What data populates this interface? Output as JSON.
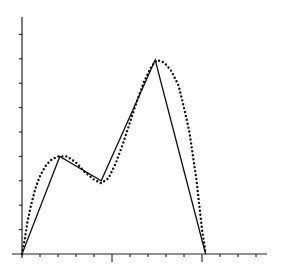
{
  "chart_data": {
    "type": "line",
    "title": "",
    "xlabel": "",
    "ylabel": "",
    "grid": false,
    "legend": null,
    "xlim": [
      -0.55,
      13.6
    ],
    "ylim": [
      0,
      9.7
    ],
    "x_ticks": [
      1,
      2,
      3,
      4,
      5,
      6,
      7,
      8,
      9,
      10,
      11,
      12,
      13
    ],
    "x_major_ticks": [
      5,
      10
    ],
    "y_ticks": [
      1,
      2,
      3,
      4,
      5,
      6,
      7,
      8,
      9
    ],
    "tick_labels_visible": false,
    "series": [
      {
        "name": "piecewise-linear",
        "style": "solid",
        "color": "#111111",
        "points": [
          [
            0,
            0
          ],
          [
            2.1,
            4.0
          ],
          [
            4.4,
            3.0
          ],
          [
            7.4,
            7.95
          ],
          [
            10.2,
            0
          ]
        ]
      },
      {
        "name": "smooth-curve",
        "style": "dotted",
        "color": "#111111",
        "points": [
          [
            0,
            0
          ],
          [
            0.15,
            0.6
          ],
          [
            0.3,
            1.3
          ],
          [
            0.5,
            2.0
          ],
          [
            0.75,
            2.7
          ],
          [
            1.0,
            3.2
          ],
          [
            1.3,
            3.6
          ],
          [
            1.6,
            3.85
          ],
          [
            2.0,
            4.0
          ],
          [
            2.5,
            4.0
          ],
          [
            3.0,
            3.75
          ],
          [
            3.5,
            3.35
          ],
          [
            4.0,
            3.05
          ],
          [
            4.4,
            2.9
          ],
          [
            4.8,
            3.1
          ],
          [
            5.2,
            3.7
          ],
          [
            5.6,
            4.5
          ],
          [
            6.0,
            5.4
          ],
          [
            6.4,
            6.3
          ],
          [
            6.8,
            7.1
          ],
          [
            7.2,
            7.7
          ],
          [
            7.5,
            7.95
          ],
          [
            7.9,
            7.85
          ],
          [
            8.3,
            7.5
          ],
          [
            8.7,
            6.9
          ],
          [
            9.0,
            6.0
          ],
          [
            9.3,
            5.0
          ],
          [
            9.5,
            4.0
          ],
          [
            9.7,
            3.0
          ],
          [
            9.85,
            2.0
          ],
          [
            10.0,
            1.0
          ],
          [
            10.15,
            0.3
          ],
          [
            10.2,
            0
          ]
        ]
      }
    ]
  }
}
